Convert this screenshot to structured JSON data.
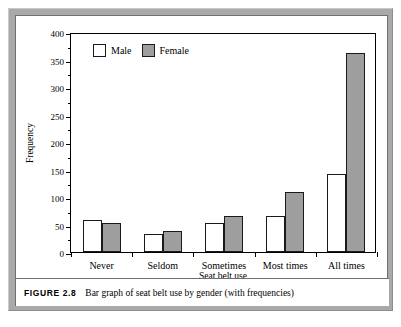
{
  "figure": {
    "number_label": "FIGURE 2.8",
    "caption": "Bar graph of seat belt use by gender (with frequencies)"
  },
  "legend": {
    "position": "top-left-inside",
    "entries": [
      {
        "label": "Male",
        "color": "#ffffff",
        "name": "male"
      },
      {
        "label": "Female",
        "color": "#9e9e9e",
        "name": "female"
      }
    ]
  },
  "axes": {
    "y_title": "Frequency",
    "x_title": "Seat belt use",
    "y_ticks": [
      "0",
      "50",
      "100",
      "150",
      "200",
      "250",
      "300",
      "350",
      "400"
    ]
  },
  "chart_data": {
    "type": "bar",
    "title": "",
    "subtitle": "",
    "xlabel": "Seat belt use",
    "ylabel": "Frequency",
    "categories": [
      "Never",
      "Seldom",
      "Sometimes",
      "Most times",
      "All times"
    ],
    "series": [
      {
        "name": "Male",
        "color": "#ffffff",
        "values": [
          59,
          33,
          53,
          65,
          141
        ]
      },
      {
        "name": "Female",
        "color": "#9e9e9e",
        "values": [
          53,
          39,
          65,
          109,
          361
        ]
      }
    ],
    "ylim": [
      0,
      400
    ],
    "ytick_step": 50,
    "yminor_step": 25,
    "grid": false,
    "legend": "inside top-left"
  }
}
